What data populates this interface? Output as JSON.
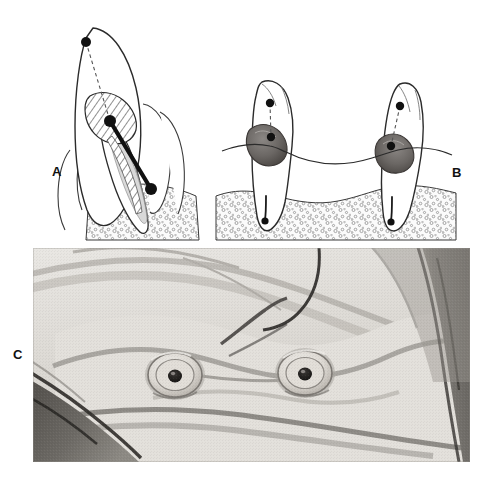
{
  "figure": {
    "kind": "three-panel-dental-illustration",
    "width": 498,
    "height": 479,
    "background_color": "#ffffff"
  },
  "panels": [
    {
      "id": "A",
      "label": "A",
      "label_position": {
        "x": 52,
        "y": 165
      },
      "type": "line-drawing",
      "subject": "single-tooth-sagittal-section-with-post",
      "description": "Sagittal line drawing of an anterior tooth sectioned to show a cross-hatched coronal restoration and a heavy black post seated in the root canal, with reference dots at the incisal tip, the restoration core and the post apex, joined by a dashed alignment line.",
      "elements": [
        {
          "name": "incisal-reference-dot",
          "x": 86,
          "y": 42,
          "radius": 5,
          "color": "#111111"
        },
        {
          "name": "core-reference-dot",
          "x": 110,
          "y": 121,
          "radius": 6,
          "color": "#111111"
        },
        {
          "name": "post-apex-reference-dot",
          "x": 151,
          "y": 189,
          "radius": 6,
          "color": "#111111"
        },
        {
          "name": "dashed-alignment-line",
          "from": [
            86,
            42
          ],
          "to": [
            110,
            121
          ],
          "style": "dashed"
        },
        {
          "name": "post",
          "from": [
            110,
            121
          ],
          "to": [
            151,
            189
          ],
          "style": "thick-solid",
          "color": "#111111"
        },
        {
          "name": "hatched-restoration",
          "fill": "diagonal-hatch"
        },
        {
          "name": "alveolar-bone",
          "fill": "stipple"
        }
      ]
    },
    {
      "id": "B",
      "label": "B",
      "label_position": {
        "x": 452,
        "y": 166
      },
      "type": "line-drawing",
      "subject": "two-abutment-teeth-with-gingival-lesions",
      "description": "Two opposing abutment teeth shown in section, each with a dark grey restoration or caries mass at the gingival margin, a reference dot in the crown joined by a dashed line to that mass, a fine root-canal line ending in an apex dot, and a sagging curved line spanning between the two teeth over stippled alveolar bone.",
      "elements": [
        {
          "name": "left-tooth-crown-dot",
          "x": 270,
          "y": 103,
          "radius": 4,
          "color": "#111111"
        },
        {
          "name": "left-tooth-lesion-dot",
          "x": 271,
          "y": 137,
          "radius": 4,
          "color": "#111111"
        },
        {
          "name": "left-tooth-apex-dot",
          "x": 265,
          "y": 221,
          "radius": 4,
          "color": "#111111"
        },
        {
          "name": "right-tooth-crown-dot",
          "x": 400,
          "y": 106,
          "radius": 4,
          "color": "#111111"
        },
        {
          "name": "right-tooth-lesion-dot",
          "x": 391,
          "y": 146,
          "radius": 4,
          "color": "#111111"
        },
        {
          "name": "right-tooth-apex-dot",
          "x": 391,
          "y": 222,
          "radius": 4,
          "color": "#111111"
        },
        {
          "name": "connecting-span-line",
          "style": "curved-sagging"
        },
        {
          "name": "lesion-mass-fill",
          "color": "#6e6a68"
        },
        {
          "name": "alveolar-bone",
          "fill": "stipple"
        }
      ]
    },
    {
      "id": "C",
      "label": "C",
      "label_position": {
        "x": 13,
        "y": 348
      },
      "type": "clinical-photograph",
      "subject": "mandibular-arch-with-two-prepared-root-faces",
      "description": "Black and white intra-oral photograph of a lower arch. Two domed root faces sit at the crest of the ridge, each showing a dark central canal opening. Mucosa fills the frame, with a dark retracted lip and instrument at the lower left and shadowed tissue at the right edge.",
      "frame": {
        "x": 33,
        "y": 248,
        "width": 437,
        "height": 214
      },
      "elements": [
        {
          "name": "left-root-face",
          "x": 175,
          "y": 375,
          "radius_outer": 26,
          "canal_radius": 7
        },
        {
          "name": "right-root-face",
          "x": 305,
          "y": 373,
          "radius_outer": 26,
          "canal_radius": 7
        },
        {
          "name": "ridge-crest-shadow",
          "tone": "dark-grey"
        },
        {
          "name": "retractor-shadow-left",
          "tone": "dark-grey"
        },
        {
          "name": "cheek-shadow-right",
          "tone": "dark-grey"
        }
      ]
    }
  ],
  "colors": {
    "ink": "#1a1a1a",
    "outline": "#2b2b2b",
    "lesion_grey": "#6e6a68",
    "lesion_grey_dark": "#4a4644",
    "bone_stipple": "#8a8a8a",
    "photo_light": "#e8e6e2",
    "photo_mid": "#b9b6b1",
    "photo_dark": "#55524e",
    "paper": "#ffffff"
  }
}
